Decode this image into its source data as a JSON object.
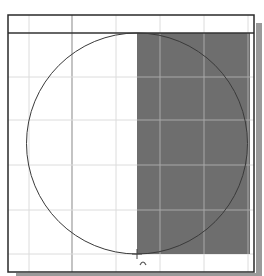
{
  "viewport": {
    "title": "",
    "background": "#ffffff"
  },
  "frame": {
    "x": 8,
    "y": 15,
    "width": 246,
    "height": 257,
    "stroke": "#2a2a2a",
    "shadow_color": "#9a9a9a"
  },
  "grid": {
    "minor_color": "#dcdcdc",
    "major_color": "#9c9c9c",
    "vertical_lines": [
      {
        "x": 29,
        "major": false
      },
      {
        "x": 72,
        "major": true
      },
      {
        "x": 116,
        "major": false
      },
      {
        "x": 160,
        "major": false
      },
      {
        "x": 204,
        "major": false
      },
      {
        "x": 248,
        "major": false
      }
    ],
    "horizontal_lines": [
      {
        "y": 77,
        "major": false
      },
      {
        "y": 120,
        "major": false
      },
      {
        "y": 165,
        "major": false
      },
      {
        "y": 210,
        "major": false
      },
      {
        "y": 254,
        "major": false
      }
    ],
    "on_fill_color": "#a8a8a8"
  },
  "guide_line": {
    "y": 33,
    "stroke": "#333333"
  },
  "selection_rect": {
    "x": 137,
    "y": 33,
    "width": 113,
    "height": 221,
    "fill": "#6e6e6e"
  },
  "circle": {
    "cx": 137,
    "cy": 143.5,
    "r": 110.5,
    "stroke": "#3a3a3a"
  },
  "snap_point": {
    "x": 137,
    "y": 254,
    "label": "+"
  },
  "cursor": {
    "glyph": "∩",
    "icon": "arc-tool-cursor-icon"
  }
}
